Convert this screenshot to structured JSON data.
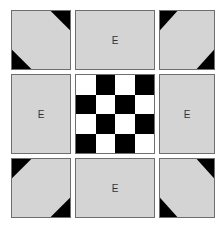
{
  "diagram": {
    "colors": {
      "tile_fill": "#d4d4d4",
      "border": "#6e6e6e",
      "black": "#000000",
      "white": "#ffffff"
    },
    "tiles": [
      {
        "id": "top-left",
        "label": "",
        "corners": [
          "tr",
          "bl"
        ]
      },
      {
        "id": "top-center",
        "label": "E",
        "corners": []
      },
      {
        "id": "top-right",
        "label": "",
        "corners": [
          "tl",
          "br"
        ]
      },
      {
        "id": "middle-left",
        "label": "E",
        "corners": []
      },
      {
        "id": "center",
        "label": "",
        "type": "checkerboard"
      },
      {
        "id": "middle-right",
        "label": "E",
        "corners": []
      },
      {
        "id": "bottom-left",
        "label": "",
        "corners": [
          "tl",
          "br"
        ]
      },
      {
        "id": "bottom-center",
        "label": "E",
        "corners": []
      },
      {
        "id": "bottom-right",
        "label": "",
        "corners": [
          "tr",
          "bl"
        ]
      }
    ],
    "checkerboard": {
      "rows": 4,
      "cols": 4,
      "cells": [
        [
          "white",
          "black",
          "white",
          "black"
        ],
        [
          "black",
          "white",
          "black",
          "white"
        ],
        [
          "white",
          "black",
          "white",
          "black"
        ],
        [
          "black",
          "white",
          "black",
          "white"
        ]
      ]
    }
  }
}
